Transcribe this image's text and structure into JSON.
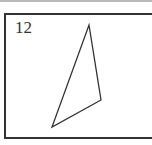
{
  "figure": {
    "label": "12",
    "shape": "triangle",
    "vertices": [
      [
        89,
        25
      ],
      [
        101,
        100
      ],
      [
        52,
        127
      ]
    ],
    "stroke_color": "#333333",
    "frame_color": "#333333"
  }
}
